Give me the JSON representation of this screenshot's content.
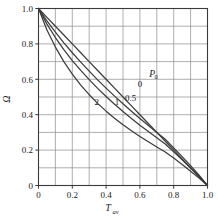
{
  "chart_data": {
    "type": "line",
    "title": "",
    "subtitle": "",
    "xlabel": "T_av",
    "xlabel_base": "T",
    "xlabel_sub": "av",
    "ylabel": "Ω",
    "xlim": [
      0,
      1.0
    ],
    "ylim": [
      0,
      1.0
    ],
    "grid": true,
    "grid_step_x": 0.1,
    "grid_step_y": 0.1,
    "xticks": [
      0,
      0.2,
      0.4,
      0.6,
      0.8,
      1.0
    ],
    "xtick_labels": [
      "0",
      "0.2",
      "0.4",
      "0.6",
      "0.8",
      "1.0"
    ],
    "yticks": [
      0,
      0.2,
      0.4,
      0.6,
      0.8,
      1.0
    ],
    "ytick_labels": [
      "0",
      "0.2",
      "0.4",
      "0.6",
      "0.8",
      "1.0"
    ],
    "legend_position": "inline-curve-labels",
    "legend_title": "P0",
    "legend_title_base": "P",
    "legend_title_sub": "0",
    "series": [
      {
        "name": "0",
        "label": "0",
        "label_x": 0.6,
        "label_y": 0.555,
        "points": [
          [
            0.0,
            1.0
          ],
          [
            0.05,
            0.95
          ],
          [
            0.1,
            0.9
          ],
          [
            0.15,
            0.85
          ],
          [
            0.2,
            0.8
          ],
          [
            0.25,
            0.75
          ],
          [
            0.3,
            0.7
          ],
          [
            0.35,
            0.65
          ],
          [
            0.4,
            0.6
          ],
          [
            0.45,
            0.55
          ],
          [
            0.5,
            0.5
          ],
          [
            0.55,
            0.45
          ],
          [
            0.6,
            0.4
          ],
          [
            0.65,
            0.35
          ],
          [
            0.7,
            0.3
          ],
          [
            0.75,
            0.25
          ],
          [
            0.8,
            0.2
          ],
          [
            0.85,
            0.15
          ],
          [
            0.9,
            0.1
          ],
          [
            0.95,
            0.05
          ],
          [
            1.0,
            0.0
          ]
        ]
      },
      {
        "name": "0.5",
        "label": "0.5",
        "label_x": 0.545,
        "label_y": 0.475,
        "points": [
          [
            0.0,
            1.0
          ],
          [
            0.05,
            0.93
          ],
          [
            0.1,
            0.866
          ],
          [
            0.15,
            0.806
          ],
          [
            0.2,
            0.75
          ],
          [
            0.25,
            0.697
          ],
          [
            0.3,
            0.646
          ],
          [
            0.35,
            0.597
          ],
          [
            0.4,
            0.55
          ],
          [
            0.45,
            0.505
          ],
          [
            0.5,
            0.462
          ],
          [
            0.55,
            0.42
          ],
          [
            0.6,
            0.379
          ],
          [
            0.65,
            0.339
          ],
          [
            0.7,
            0.3
          ],
          [
            0.75,
            0.261
          ],
          [
            0.8,
            0.212
          ],
          [
            0.85,
            0.163
          ],
          [
            0.9,
            0.112
          ],
          [
            0.95,
            0.058
          ],
          [
            1.0,
            0.0
          ]
        ]
      },
      {
        "name": "1",
        "label": "1",
        "label_x": 0.465,
        "label_y": 0.455,
        "points": [
          [
            0.0,
            1.0
          ],
          [
            0.05,
            0.912
          ],
          [
            0.1,
            0.836
          ],
          [
            0.15,
            0.768
          ],
          [
            0.2,
            0.706
          ],
          [
            0.25,
            0.65
          ],
          [
            0.3,
            0.598
          ],
          [
            0.35,
            0.549
          ],
          [
            0.4,
            0.503
          ],
          [
            0.45,
            0.459
          ],
          [
            0.5,
            0.418
          ],
          [
            0.55,
            0.379
          ],
          [
            0.6,
            0.341
          ],
          [
            0.65,
            0.305
          ],
          [
            0.7,
            0.27
          ],
          [
            0.75,
            0.234
          ],
          [
            0.8,
            0.19
          ],
          [
            0.85,
            0.145
          ],
          [
            0.9,
            0.099
          ],
          [
            0.95,
            0.051
          ],
          [
            1.0,
            0.0
          ]
        ]
      },
      {
        "name": "2",
        "label": "2",
        "label_x": 0.345,
        "label_y": 0.455,
        "points": [
          [
            0.0,
            1.0
          ],
          [
            0.05,
            0.878
          ],
          [
            0.1,
            0.782
          ],
          [
            0.15,
            0.7
          ],
          [
            0.2,
            0.629
          ],
          [
            0.25,
            0.567
          ],
          [
            0.3,
            0.513
          ],
          [
            0.35,
            0.464
          ],
          [
            0.4,
            0.42
          ],
          [
            0.45,
            0.38
          ],
          [
            0.5,
            0.343
          ],
          [
            0.55,
            0.309
          ],
          [
            0.6,
            0.277
          ],
          [
            0.65,
            0.247
          ],
          [
            0.7,
            0.218
          ],
          [
            0.75,
            0.189
          ],
          [
            0.8,
            0.155
          ],
          [
            0.85,
            0.119
          ],
          [
            0.9,
            0.081
          ],
          [
            0.95,
            0.042
          ],
          [
            1.0,
            0.0
          ]
        ]
      }
    ]
  },
  "style": {
    "curve_color": "#3c3c3c",
    "grid_color": "#8c8c8c",
    "frame_color": "#3a3a3a",
    "background": "#ffffff"
  }
}
